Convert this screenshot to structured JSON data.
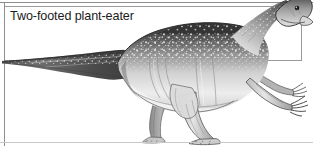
{
  "figure": {
    "caption": "Two-footed plant-eater",
    "illustration_style": "black-and-white stippled engraving",
    "colors": {
      "background": "#ffffff",
      "rule_top": "#8d8d8d",
      "rule_bottom": "#c9c9c9",
      "caption_border": "#9a9a9a",
      "caption_text": "#1b1b1b",
      "ink_dark": "#2b2b2b",
      "ink_mid": "#7a7a7a",
      "ink_light": "#cdcdcd"
    },
    "parts": [
      {
        "name": "head",
        "label": "head with eye and beaked snout"
      },
      {
        "name": "neck",
        "label": "neck"
      },
      {
        "name": "body",
        "label": "mottled dark back, pale belly"
      },
      {
        "name": "tail",
        "label": "long tapering tail"
      },
      {
        "name": "forelimb-near",
        "label": "near forelimb with clawed hand"
      },
      {
        "name": "forelimb-far",
        "label": "far forelimb with clawed hand"
      },
      {
        "name": "hindlimb-near",
        "label": "near hind leg, three-toed foot"
      },
      {
        "name": "hindlimb-far",
        "label": "far hind leg, three-toed foot"
      }
    ]
  }
}
